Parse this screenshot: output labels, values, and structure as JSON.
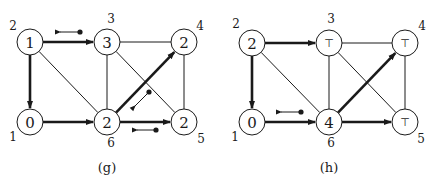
{
  "figures": [
    {
      "caption": "(g)",
      "nodes": [
        {
          "id": "1",
          "value": "0",
          "cx": 30,
          "cy": 122,
          "label_x": 13,
          "label_y": 137
        },
        {
          "id": "2",
          "value": "1",
          "cx": 30,
          "cy": 42,
          "label_x": 13,
          "label_y": 26
        },
        {
          "id": "3",
          "value": "3",
          "cx": 107,
          "cy": 42,
          "label_x": 111,
          "label_y": 19
        },
        {
          "id": "4",
          "value": "2",
          "cx": 184,
          "cy": 42,
          "label_x": 200,
          "label_y": 26
        },
        {
          "id": "5",
          "value": "2",
          "cx": 184,
          "cy": 122,
          "label_x": 201,
          "label_y": 139
        },
        {
          "id": "6",
          "value": "2",
          "cx": 107,
          "cy": 122,
          "label_x": 111,
          "label_y": 143
        }
      ],
      "edges": [
        {
          "from": "2",
          "to": "3",
          "bold": true,
          "arrow": true
        },
        {
          "from": "2",
          "to": "1",
          "bold": true,
          "arrow": true
        },
        {
          "from": "2",
          "to": "6",
          "bold": false,
          "arrow": false
        },
        {
          "from": "1",
          "to": "6",
          "bold": true,
          "arrow": true
        },
        {
          "from": "3",
          "to": "4",
          "bold": false,
          "arrow": false
        },
        {
          "from": "3",
          "to": "6",
          "bold": false,
          "arrow": false
        },
        {
          "from": "3",
          "to": "5",
          "bold": false,
          "arrow": false
        },
        {
          "from": "6",
          "to": "4",
          "bold": true,
          "arrow": true
        },
        {
          "from": "6",
          "to": "5",
          "bold": true,
          "arrow": true
        },
        {
          "from": "4",
          "to": "5",
          "bold": false,
          "arrow": false
        }
      ],
      "indicators": [
        {
          "dot_x": 80,
          "dot_y": 32,
          "tip_x": 60,
          "tip_y": 32
        },
        {
          "dot_x": 149,
          "dot_y": 92,
          "tip_x": 135,
          "tip_y": 106
        },
        {
          "dot_x": 156,
          "dot_y": 130,
          "tip_x": 137,
          "tip_y": 130
        }
      ],
      "caption_x": 107,
      "caption_y": 167
    },
    {
      "caption": "(h)",
      "nodes": [
        {
          "id": "1",
          "value": "0",
          "cx": 252,
          "cy": 122,
          "label_x": 235,
          "label_y": 137
        },
        {
          "id": "2",
          "value": "2",
          "cx": 252,
          "cy": 43,
          "label_x": 236,
          "label_y": 24
        },
        {
          "id": "3",
          "value": "⊤",
          "cx": 329,
          "cy": 43,
          "label_x": 331,
          "label_y": 19
        },
        {
          "id": "4",
          "value": "⊤",
          "cx": 405,
          "cy": 43,
          "label_x": 422,
          "label_y": 26
        },
        {
          "id": "5",
          "value": "⊤",
          "cx": 405,
          "cy": 122,
          "label_x": 421,
          "label_y": 139
        },
        {
          "id": "6",
          "value": "4",
          "cx": 329,
          "cy": 122,
          "label_x": 331,
          "label_y": 143
        }
      ],
      "edges": [
        {
          "from": "2",
          "to": "3",
          "bold": true,
          "arrow": true
        },
        {
          "from": "2",
          "to": "1",
          "bold": true,
          "arrow": true
        },
        {
          "from": "2",
          "to": "6",
          "bold": false,
          "arrow": false
        },
        {
          "from": "1",
          "to": "6",
          "bold": true,
          "arrow": true
        },
        {
          "from": "3",
          "to": "4",
          "bold": false,
          "arrow": false
        },
        {
          "from": "3",
          "to": "6",
          "bold": false,
          "arrow": false
        },
        {
          "from": "3",
          "to": "5",
          "bold": false,
          "arrow": false
        },
        {
          "from": "6",
          "to": "4",
          "bold": true,
          "arrow": true
        },
        {
          "from": "6",
          "to": "5",
          "bold": true,
          "arrow": true
        },
        {
          "from": "4",
          "to": "5",
          "bold": false,
          "arrow": false
        }
      ],
      "indicators": [
        {
          "dot_x": 301,
          "dot_y": 112,
          "tip_x": 281,
          "tip_y": 112
        }
      ],
      "caption_x": 329,
      "caption_y": 167
    }
  ],
  "style": {
    "stroke_color": "#1a1a1a",
    "background": "#ffffff",
    "node_radius": 13
  }
}
